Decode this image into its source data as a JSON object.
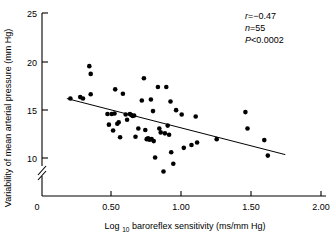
{
  "chart_data": {
    "type": "scatter",
    "title": "",
    "xlabel": "Log 10 baroreflex sensitivity (ms/mm Hg)",
    "xlabel_main": "Log",
    "xlabel_sub": "10",
    "xlabel_rest": "baroreflex sensitivity (ms/mm Hg)",
    "ylabel": "Variability of mean arterial pressure (mm Hg)",
    "xlim": [
      0,
      2.0
    ],
    "ylim": [
      0,
      25
    ],
    "y_axis_break": true,
    "y_break_between": [
      0,
      10
    ],
    "grid": false,
    "legend": "none",
    "xticks": [
      0,
      0.5,
      1.0,
      1.5,
      2.0
    ],
    "xtick_labels": [
      "0",
      "0.50",
      "1.00",
      "1.50",
      "2.00"
    ],
    "yticks": [
      0,
      10,
      15,
      20,
      25
    ],
    "ytick_labels": [
      "0",
      "10",
      "15",
      "20",
      "25"
    ],
    "annotations": {
      "r_label": "r",
      "r_value": "=−0.47",
      "n_label": "n",
      "n_value": "=55",
      "p_label": "P",
      "p_value": "<0.0002"
    },
    "regression_line": {
      "x_start": 0.185,
      "y_start": 16.15,
      "x_end": 1.745,
      "y_end": 10.35
    },
    "series": [
      {
        "name": "subjects",
        "marker": "filled-circle",
        "color": "#000000",
        "n": 55,
        "points": [
          [
            0.21,
            16.15
          ],
          [
            0.28,
            16.3
          ],
          [
            0.3,
            16.15
          ],
          [
            0.345,
            19.5
          ],
          [
            0.355,
            18.7
          ],
          [
            0.355,
            16.6
          ],
          [
            0.475,
            14.55
          ],
          [
            0.485,
            13.45
          ],
          [
            0.505,
            14.55
          ],
          [
            0.515,
            12.85
          ],
          [
            0.525,
            14.6
          ],
          [
            0.53,
            17.1
          ],
          [
            0.545,
            13.55
          ],
          [
            0.555,
            13.7
          ],
          [
            0.565,
            12.15
          ],
          [
            0.585,
            16.65
          ],
          [
            0.605,
            14.5
          ],
          [
            0.615,
            13.95
          ],
          [
            0.635,
            14.55
          ],
          [
            0.645,
            14.45
          ],
          [
            0.655,
            14.35
          ],
          [
            0.665,
            14.4
          ],
          [
            0.675,
            12.2
          ],
          [
            0.695,
            13.05
          ],
          [
            0.72,
            15.95
          ],
          [
            0.735,
            18.25
          ],
          [
            0.745,
            12.9
          ],
          [
            0.755,
            11.95
          ],
          [
            0.765,
            12.05
          ],
          [
            0.775,
            11.9
          ],
          [
            0.785,
            16.05
          ],
          [
            0.79,
            11.95
          ],
          [
            0.8,
            14.85
          ],
          [
            0.805,
            11.75
          ],
          [
            0.815,
            10.05
          ],
          [
            0.835,
            17.35
          ],
          [
            0.845,
            13.05
          ],
          [
            0.855,
            12.65
          ],
          [
            0.875,
            8.6
          ],
          [
            0.885,
            12.55
          ],
          [
            0.895,
            17.35
          ],
          [
            0.905,
            13.35
          ],
          [
            0.915,
            12.4
          ],
          [
            0.925,
            15.85
          ],
          [
            0.93,
            10.6
          ],
          [
            0.945,
            9.4
          ],
          [
            0.965,
            14.95
          ],
          [
            1.005,
            14.5
          ],
          [
            1.02,
            11.05
          ],
          [
            1.075,
            11.35
          ],
          [
            1.105,
            14.3
          ],
          [
            1.115,
            11.6
          ],
          [
            1.255,
            11.95
          ],
          [
            1.46,
            14.75
          ],
          [
            1.475,
            13.05
          ],
          [
            1.595,
            11.85
          ],
          [
            1.62,
            10.25
          ]
        ]
      }
    ]
  }
}
